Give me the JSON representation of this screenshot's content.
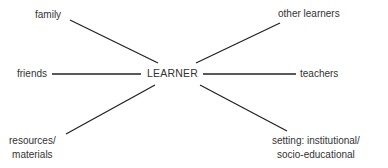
{
  "diagram": {
    "center": {
      "label": "LEARNER"
    },
    "nodes": [
      {
        "id": "family",
        "label": "family"
      },
      {
        "id": "friends",
        "label": "friends"
      },
      {
        "id": "resources",
        "lines": [
          "resources/",
          "materials"
        ]
      },
      {
        "id": "other-learners",
        "label": "other learners"
      },
      {
        "id": "teachers",
        "label": "teachers"
      },
      {
        "id": "setting",
        "lines": [
          "setting: institutional/",
          "socio-educational"
        ]
      }
    ],
    "line_color": "#222222",
    "text_color": "#333333"
  }
}
